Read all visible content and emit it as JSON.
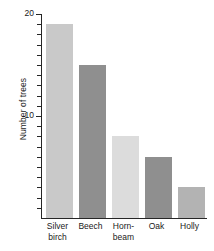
{
  "chart_data": {
    "type": "bar",
    "title": "",
    "xlabel": "",
    "ylabel": "Number of trees",
    "categories": [
      "Silver birch",
      "Beech",
      "Horn-beam",
      "Oak",
      "Holly"
    ],
    "category_display": [
      "Silver\nbirch",
      "Beech",
      "Horn-\nbeam",
      "Oak",
      "Holly"
    ],
    "values": [
      19,
      15,
      8,
      6,
      3
    ],
    "ylim": [
      0,
      20
    ],
    "ytick_labels": [
      "10",
      "20"
    ],
    "ytick_values": [
      10,
      20
    ],
    "minor_tick_interval": 1,
    "grid": false,
    "legend": "none",
    "bar_colors": [
      "#c9c9c9",
      "#8f8f8f",
      "#dcdcdc",
      "#8f8f8f",
      "#b3b3b3"
    ],
    "axis_color": "#262626"
  }
}
